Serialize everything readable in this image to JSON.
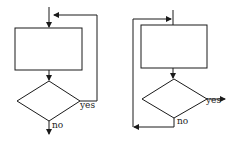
{
  "diagrams": [
    {
      "name": "post-test-loop",
      "labels": {
        "yes": "yes",
        "no": "no"
      }
    },
    {
      "name": "pre-test-loop",
      "labels": {
        "yes": "yes",
        "no": "no"
      }
    }
  ],
  "colors": {
    "stroke": "#1a1a1a",
    "background": "#ffffff"
  }
}
